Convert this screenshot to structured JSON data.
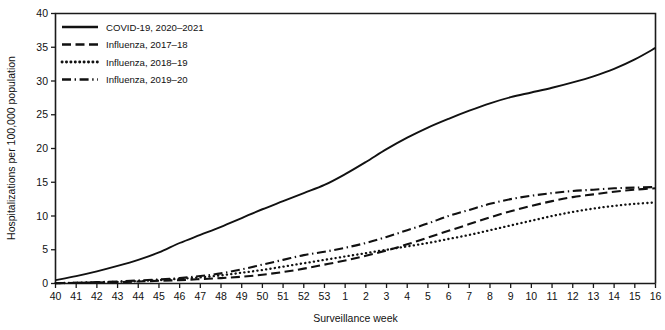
{
  "chart_data": {
    "type": "line",
    "title": "",
    "xlabel": "Surveillance week",
    "ylabel": "Hospitalizations per 100,000 population",
    "ylim": [
      0,
      40
    ],
    "yticks": [
      0,
      5,
      10,
      15,
      20,
      25,
      30,
      35,
      40
    ],
    "grid": false,
    "legend_position": "top-left",
    "categories": [
      "40",
      "41",
      "42",
      "43",
      "44",
      "45",
      "46",
      "47",
      "48",
      "49",
      "50",
      "51",
      "52",
      "53",
      "1",
      "2",
      "3",
      "4",
      "5",
      "6",
      "7",
      "8",
      "9",
      "10",
      "11",
      "12",
      "13",
      "14",
      "15",
      "16"
    ],
    "series": [
      {
        "name": "COVID-19, 2020–2021",
        "style": "solid",
        "color": "#111111",
        "values": [
          0.5,
          1.1,
          1.8,
          2.6,
          3.5,
          4.6,
          6.0,
          7.2,
          8.4,
          9.7,
          11.0,
          12.2,
          13.4,
          14.6,
          16.2,
          18.0,
          19.9,
          21.6,
          23.1,
          24.4,
          25.6,
          26.7,
          27.6,
          28.3,
          29.0,
          29.8,
          30.7,
          31.8,
          33.2,
          34.9
        ]
      },
      {
        "name": "Influenza, 2017–18",
        "style": "dashed",
        "color": "#111111",
        "values": [
          0.05,
          0.1,
          0.15,
          0.2,
          0.3,
          0.4,
          0.5,
          0.65,
          0.8,
          1.0,
          1.3,
          1.7,
          2.2,
          2.8,
          3.4,
          4.1,
          4.9,
          5.8,
          6.8,
          7.8,
          8.8,
          9.8,
          10.7,
          11.5,
          12.2,
          12.8,
          13.2,
          13.6,
          13.9,
          14.1
        ]
      },
      {
        "name": "Influenza, 2018–19",
        "style": "dotted",
        "color": "#111111",
        "values": [
          0.05,
          0.1,
          0.15,
          0.25,
          0.35,
          0.5,
          0.7,
          0.9,
          1.2,
          1.6,
          2.0,
          2.5,
          3.0,
          3.5,
          4.0,
          4.5,
          5.0,
          5.5,
          6.0,
          6.6,
          7.2,
          7.9,
          8.6,
          9.3,
          10.0,
          10.6,
          11.1,
          11.5,
          11.8,
          12.0
        ]
      },
      {
        "name": "Influenza, 2019–20",
        "style": "dashdot",
        "color": "#111111",
        "values": [
          0.05,
          0.1,
          0.2,
          0.3,
          0.45,
          0.6,
          0.8,
          1.1,
          1.5,
          2.1,
          2.8,
          3.5,
          4.2,
          4.7,
          5.3,
          6.0,
          6.9,
          7.9,
          8.9,
          10.0,
          10.9,
          11.8,
          12.5,
          13.0,
          13.4,
          13.7,
          13.9,
          14.1,
          14.2,
          14.3
        ]
      }
    ]
  },
  "axes": {
    "x_title": "Surveillance week",
    "y_title": "Hospitalizations per 100,000 population"
  },
  "legend": {
    "items": [
      {
        "label": "COVID-19, 2020–2021"
      },
      {
        "label": "Influenza, 2017–18"
      },
      {
        "label": "Influenza, 2018–19"
      },
      {
        "label": "Influenza, 2019–20"
      }
    ]
  }
}
